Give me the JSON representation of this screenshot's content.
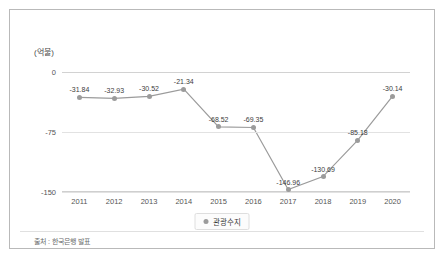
{
  "unit_label": "(억불)",
  "source_note": "출처 : 한국은행 발표",
  "legend": {
    "marker": "circle-marker",
    "label": "관광수지"
  },
  "colors": {
    "line": "#9b9b9b",
    "marker": "#9b9b9b",
    "frame": "#b9b9b9",
    "grid": "#e2e2e2",
    "text": "#3d3d3d"
  },
  "chart_data": {
    "type": "line",
    "title": "",
    "xlabel": "",
    "ylabel": "(억불)",
    "categories": [
      "2011",
      "2012",
      "2013",
      "2014",
      "2015",
      "2016",
      "2017",
      "2018",
      "2019",
      "2020"
    ],
    "series": [
      {
        "name": "관광수지",
        "values": [
          -31.84,
          -32.93,
          -30.52,
          -21.34,
          -68.52,
          -69.35,
          -146.96,
          -130.69,
          -85.18,
          -30.14
        ]
      }
    ],
    "point_labels": [
      "-31.84",
      "-32.93",
      "-30.52",
      "-21.34",
      "-68.52",
      "-69.35",
      "-146.96",
      "-130.69",
      "-85.18",
      "-30.14"
    ],
    "yticks": [
      0,
      -75,
      -150
    ],
    "ytick_labels": [
      "0",
      "-75",
      "-150"
    ],
    "ylim": [
      -150,
      0
    ],
    "grid": true,
    "legend_position": "bottom"
  }
}
